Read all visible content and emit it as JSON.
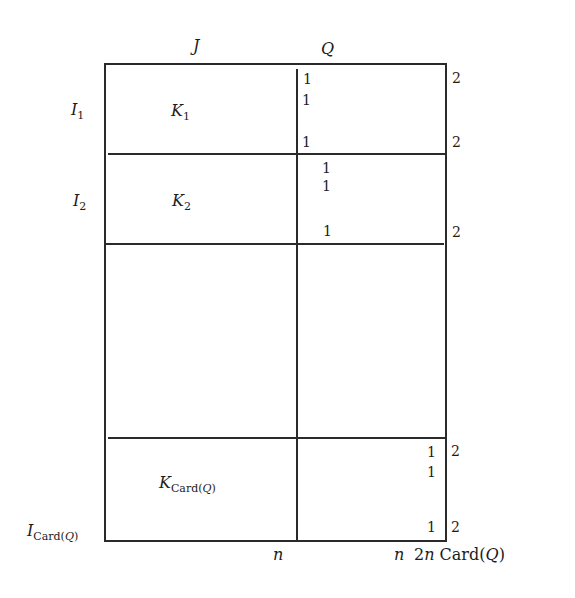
{
  "diagram": {
    "column_headers": [
      {
        "id": "J",
        "label": "J"
      },
      {
        "id": "Q",
        "label": "Q"
      }
    ],
    "row_labels": [
      {
        "id": "I1",
        "base": "I",
        "sub": "1"
      },
      {
        "id": "I2",
        "base": "I",
        "sub": "2"
      },
      {
        "id": "ICard",
        "base": "I",
        "sub_prefix": "Card(",
        "sub_var": "Q",
        "sub_suffix": ")"
      }
    ],
    "blocks": [
      {
        "id": "K1",
        "base": "K",
        "sub": "1"
      },
      {
        "id": "K2",
        "base": "K",
        "sub": "2"
      },
      {
        "id": "KCard",
        "base": "K",
        "sub_prefix": "Card(",
        "sub_var": "Q",
        "sub_suffix": ")"
      }
    ],
    "q_column_entries": {
      "block1": [
        "1",
        "1",
        "1"
      ],
      "block2": [
        "1",
        "1",
        "1"
      ],
      "blockCard": [
        "1",
        "1",
        "1"
      ]
    },
    "right_margin_values": {
      "block1": [
        "2",
        "2"
      ],
      "block2": [
        "2"
      ],
      "blockCard": [
        "2",
        "2"
      ]
    },
    "bottom_labels": {
      "mid": "n",
      "right": "n",
      "total_prefix": "2",
      "total_var": "n",
      "total_text": " Card(",
      "total_q": "Q",
      "total_suffix": ")"
    }
  }
}
